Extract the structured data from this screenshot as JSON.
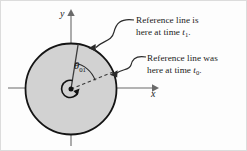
{
  "figure": {
    "background_color": "#fdfdfd",
    "border_color": "#c8c8c8"
  },
  "disk": {
    "name": "rotating-disk",
    "center_x": 71,
    "center_y": 89,
    "radius": 46,
    "fill_color": "#d2d2d2",
    "stroke_color": "#1a1a1a"
  },
  "axes": {
    "x_label": "x",
    "y_label": "y",
    "axis_color": "#5a5a5a",
    "x_start": 8,
    "x_end": 157,
    "y_start": 12,
    "y_end": 146,
    "origin_x": 71,
    "origin_y": 88
  },
  "angle": {
    "symbol": "θ",
    "subscript": "01",
    "label_color": "#111111",
    "arc_start_deg": 22,
    "arc_end_deg": 81
  },
  "reference_line_t1": {
    "name": "reference-line-time-1",
    "style": "solid",
    "angle_deg": 81,
    "color": "#3a3a3a"
  },
  "reference_line_t0": {
    "name": "reference-line-time-0",
    "style": "dashed",
    "angle_deg": 22,
    "color": "#3a3a3a"
  },
  "rotation_arrow": {
    "name": "rotation-direction-arrow",
    "color": "#111111"
  },
  "callouts": [
    {
      "id": "callout-t1",
      "line1": "Reference line is",
      "line2_prefix": "here at time ",
      "line2_symbol": "t",
      "line2_subscript": "1",
      "line2_suffix": ".",
      "leader_color": "#2a2a2a"
    },
    {
      "id": "callout-t0",
      "line1": "Reference line was",
      "line2_prefix": "here at time ",
      "line2_symbol": "t",
      "line2_subscript": "0",
      "line2_suffix": ".",
      "leader_color": "#2a2a2a"
    }
  ]
}
